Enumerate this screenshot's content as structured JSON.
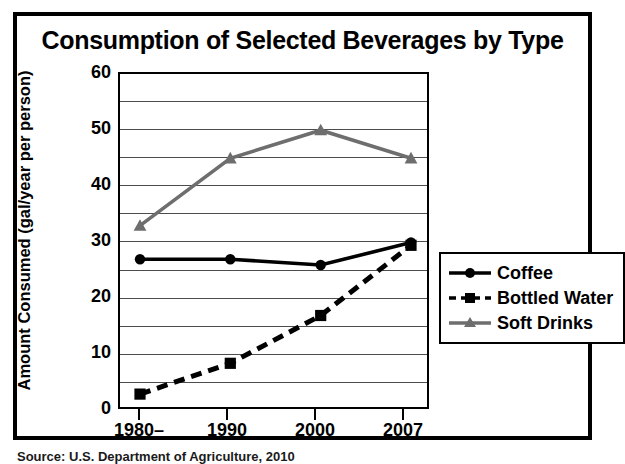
{
  "chart_data": {
    "type": "line",
    "title": "Consumption of Selected Beverages by Type",
    "xlabel": "",
    "ylabel": "Amount Consumed (gal/year per person)",
    "categories": [
      "1980–",
      "1990",
      "2000",
      "2007"
    ],
    "ylim": [
      0,
      60
    ],
    "yticks": [
      0,
      10,
      20,
      30,
      40,
      50,
      60
    ],
    "gridline_interval": 5,
    "grid": true,
    "legend_position": "right",
    "series": [
      {
        "name": "Coffee",
        "values": [
          27,
          27,
          26,
          30
        ],
        "color": "#000000",
        "line_style": "solid",
        "marker": "circle"
      },
      {
        "name": "Bottled Water",
        "values": [
          3,
          8.5,
          17,
          29.5
        ],
        "color": "#000000",
        "line_style": "dashed",
        "marker": "square"
      },
      {
        "name": "Soft Drinks",
        "values": [
          33,
          45,
          50,
          45
        ],
        "color": "#6e6e6e",
        "line_style": "solid",
        "marker": "triangle"
      }
    ]
  },
  "source_note": "Source: U.S. Department of Agriculture, 2010",
  "axis": {
    "y_tick_labels": [
      "60",
      "50",
      "40",
      "30",
      "20",
      "10",
      "0"
    ],
    "x_tick_labels": [
      "1980–",
      "1990",
      "2000",
      "2007"
    ]
  },
  "colors": {
    "frame": "#000000",
    "grid": "#4d4d4d",
    "soft_drinks": "#6e6e6e",
    "coffee": "#000000",
    "bottled_water": "#000000",
    "background": "#ffffff"
  }
}
